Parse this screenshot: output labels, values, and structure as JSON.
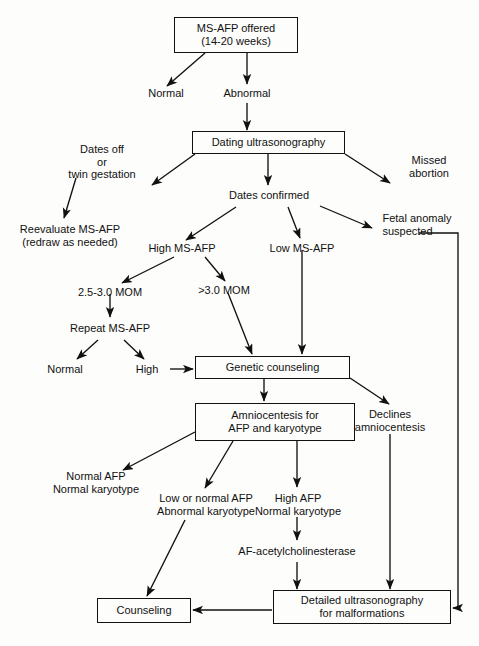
{
  "accent": "#111111",
  "background": "#fdfdfb",
  "nodes": {
    "ms_afp_offered": "MS-AFP offered\n(14-20 weeks)",
    "normal_top": "Normal",
    "abnormal_top": "Abnormal",
    "dating_ultrasonography": "Dating ultrasonography",
    "dates_off_twin": "Dates off\nor\ntwin gestation",
    "missed_abortion": "Missed\nabortion",
    "dates_confirmed": "Dates confirmed",
    "reevaluate": "Reevaluate MS-AFP\n(redraw as needed)",
    "high_ms_afp": "High MS-AFP",
    "low_ms_afp": "Low MS-AFP",
    "fetal_anomaly": "Fetal anomaly\nsuspected",
    "mom_25_30": "2.5-3.0 MOM",
    "mom_gt_30": ">3.0 MOM",
    "repeat_ms_afp": "Repeat MS-AFP",
    "normal_repeat": "Normal",
    "high_repeat": "High",
    "genetic_counseling": "Genetic counseling",
    "declines_amnio": "Declines\namniocentesis",
    "amniocentesis": "Amniocentesis for\nAFP and karyotype",
    "normal_afp_normal_karyo": "Normal AFP\nNormal karyotype",
    "low_normal_afp_abnormal_karyo": "Low or normal AFP\nAbnormal karyotype",
    "high_afp_normal_karyo": "High AFP\nNormal karyotype",
    "af_acetylcholinesterase": "AF-acetylcholinesterase",
    "counseling": "Counseling",
    "detailed_ultrasonography": "Detailed ultrasonography\nfor malformations"
  }
}
